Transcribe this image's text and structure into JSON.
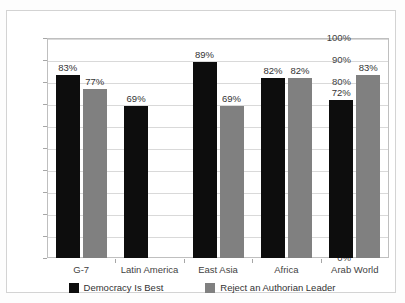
{
  "chart_data": {
    "type": "bar",
    "title": "",
    "subtitle": "",
    "xlabel": "",
    "ylabel": "",
    "ylim": [
      0,
      100
    ],
    "ytick_labels": [
      "0%",
      "10%",
      "20%",
      "30%",
      "40%",
      "50%",
      "60%",
      "70%",
      "80%",
      "90%",
      "100%"
    ],
    "ytick_values": [
      0,
      10,
      20,
      30,
      40,
      50,
      60,
      70,
      80,
      90,
      100
    ],
    "grid": true,
    "legend_position": "bottom",
    "value_label_suffix": "%",
    "categories": [
      "G-7",
      "Latin America",
      "East Asia",
      "Africa",
      "Arab World"
    ],
    "series": [
      {
        "name": "Democracy Is Best",
        "color": "#0d0d0d",
        "values": [
          83,
          69,
          89,
          82,
          72
        ],
        "labels": [
          "83%",
          "69%",
          "89%",
          "82%",
          "72%"
        ]
      },
      {
        "name": "Reject an Authorian Leader",
        "color": "#808080",
        "values": [
          77,
          null,
          69,
          82,
          83
        ],
        "labels": [
          "77%",
          "",
          "69%",
          "82%",
          "83%"
        ]
      }
    ]
  },
  "legend": {
    "items": [
      {
        "label": "Democracy Is Best",
        "swatch": "black-swatch"
      },
      {
        "label": "Reject an Authorian Leader",
        "swatch": "gray-swatch"
      }
    ]
  }
}
